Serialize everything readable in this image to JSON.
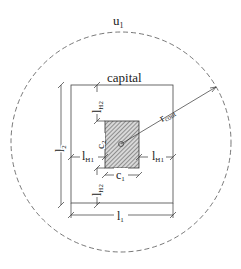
{
  "diagram": {
    "labels": {
      "perimeter": "u",
      "perimeter_sub": "1",
      "capital": "capital",
      "radius": "r",
      "radius_sub": "cont",
      "l1": "l",
      "l1_sub": "1",
      "l2": "l",
      "l2_sub": "2",
      "lH1": "l",
      "lH1_sub": "H1",
      "lH2": "l",
      "lH2_sub": "H2",
      "c1": "c",
      "c1_sub": "1",
      "c2": "c",
      "c2_sub": "2"
    },
    "colors": {
      "line": "#333333",
      "dashed": "#555555",
      "hatch": "#444444",
      "background": "#ffffff"
    }
  }
}
